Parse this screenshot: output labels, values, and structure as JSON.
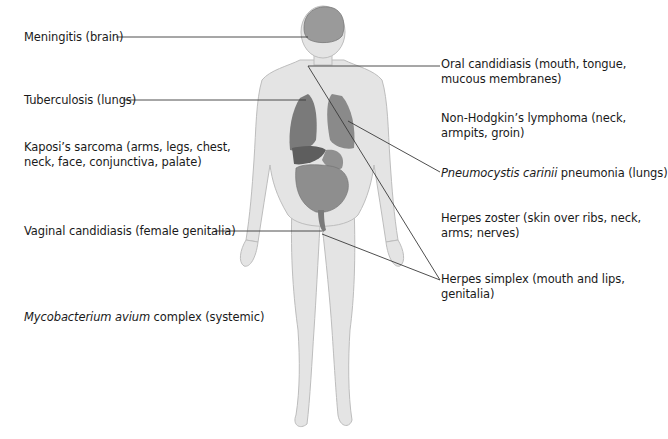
{
  "diagram": {
    "colors": {
      "skin": "#e2e2e2",
      "skin_outline": "#bdbdbd",
      "organ_dark": "#6e6e6e",
      "organ_mid": "#8c8c8c",
      "brain": "#9a9a9a",
      "leader_line": "#3a3a3a",
      "text": "#1a1a1a"
    },
    "labels_left": [
      {
        "id": "meningitis",
        "text": "Meningitis (brain)"
      },
      {
        "id": "tuberculosis",
        "text": "Tuberculosis (lungs)"
      },
      {
        "id": "kaposi",
        "line1": "Kaposi’s sarcoma (arms, legs, chest,",
        "line2": "neck, face, conjunctiva, palate)"
      },
      {
        "id": "vaginal",
        "text": "Vaginal candidiasis (female genitalia)"
      },
      {
        "id": "mac",
        "italic": "Mycobacterium avium",
        "rest": " complex (systemic)"
      }
    ],
    "labels_right": [
      {
        "id": "oral",
        "line1": "Oral candidiasis (mouth, tongue,",
        "line2": "mucous membranes)"
      },
      {
        "id": "nhl",
        "line1": "Non-Hodgkin’s lymphoma (neck,",
        "line2": "armpits, groin)"
      },
      {
        "id": "pcp",
        "italic": "Pneumocystis carinii",
        "rest": " pneumonia (lungs)"
      },
      {
        "id": "zoster",
        "line1": "Herpes zoster (skin over ribs, neck,",
        "line2": "arms; nerves)"
      },
      {
        "id": "simplex",
        "line1": "Herpes simplex (mouth and lips,",
        "line2": "genitalia)"
      }
    ]
  }
}
